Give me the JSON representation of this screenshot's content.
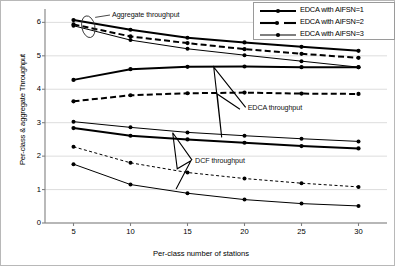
{
  "chart_data": {
    "type": "line",
    "title": "",
    "xlabel": "Per-class number of stations",
    "ylabel": "Per-class & aggregate Throughput",
    "x": [
      5,
      10,
      15,
      20,
      25,
      30
    ],
    "xlim": [
      2.5,
      32.5
    ],
    "ylim": [
      0,
      6.4
    ],
    "xticks": [
      5,
      10,
      15,
      20,
      25,
      30
    ],
    "yticks": [
      0,
      1,
      2,
      3,
      4,
      5,
      6
    ],
    "grid": "horizontal",
    "legend_position": "top-right",
    "series": [
      {
        "name": "Aggregate throughput, EDCA with AIFSN=1",
        "group": "aggregate",
        "aifsn": 1,
        "style": "solid-thick",
        "values": [
          6.07,
          5.78,
          5.54,
          5.4,
          5.27,
          5.15
        ]
      },
      {
        "name": "Aggregate throughput, EDCA with AIFSN=2",
        "group": "aggregate",
        "aifsn": 2,
        "style": "dashed",
        "values": [
          5.94,
          5.58,
          5.38,
          5.2,
          5.06,
          4.94
        ]
      },
      {
        "name": "Aggregate throughput, EDCA with AIFSN=3",
        "group": "aggregate",
        "aifsn": 3,
        "style": "solid-thin",
        "values": [
          5.9,
          5.47,
          5.21,
          5.02,
          4.84,
          4.66
        ]
      },
      {
        "name": "EDCA throughput, EDCA with AIFSN=1",
        "group": "edca",
        "aifsn": 1,
        "style": "solid-thick",
        "values": [
          4.28,
          4.6,
          4.67,
          4.68,
          4.66,
          4.66
        ]
      },
      {
        "name": "EDCA throughput, EDCA with AIFSN=2",
        "group": "edca",
        "aifsn": 2,
        "style": "dashed",
        "values": [
          3.64,
          3.82,
          3.88,
          3.9,
          3.87,
          3.86
        ]
      },
      {
        "name": "EDCA throughput, EDCA with AIFSN=3",
        "group": "edca",
        "aifsn": 3,
        "style": "solid-thin",
        "values": [
          3.03,
          2.86,
          2.71,
          2.61,
          2.52,
          2.44
        ]
      },
      {
        "name": "DCF throughput, EDCA with AIFSN=1",
        "group": "dcf",
        "aifsn": 1,
        "style": "solid-thick",
        "values": [
          2.84,
          2.61,
          2.5,
          2.4,
          2.3,
          2.23
        ]
      },
      {
        "name": "DCF throughput, EDCA with AIFSN=2",
        "group": "dcf",
        "aifsn": 2,
        "style": "dotted",
        "values": [
          2.28,
          1.8,
          1.51,
          1.33,
          1.19,
          1.08
        ]
      },
      {
        "name": "DCF throughput, EDCA with AIFSN=3",
        "group": "dcf",
        "aifsn": 3,
        "style": "solid-thin",
        "values": [
          1.76,
          1.15,
          0.89,
          0.7,
          0.58,
          0.51
        ]
      }
    ],
    "annotations": [
      {
        "id": "aggregate",
        "text": "Aggregate throughput"
      },
      {
        "id": "edca",
        "text": "EDCA throughput"
      },
      {
        "id": "dcf",
        "text": "DCF throughput"
      }
    ],
    "legend": [
      {
        "label": "EDCA with AIFSN=1",
        "style": "solid-thick"
      },
      {
        "label": "EDCA with AIFSN=2",
        "style": "dashed"
      },
      {
        "label": "EDCA with AIFSN=3",
        "style": "solid-thin"
      }
    ],
    "colors": {
      "line": "#000000",
      "grid": "#d9d9d9",
      "axis": "#808080",
      "frame": "#b8b8b8",
      "background": "#ffffff"
    }
  }
}
